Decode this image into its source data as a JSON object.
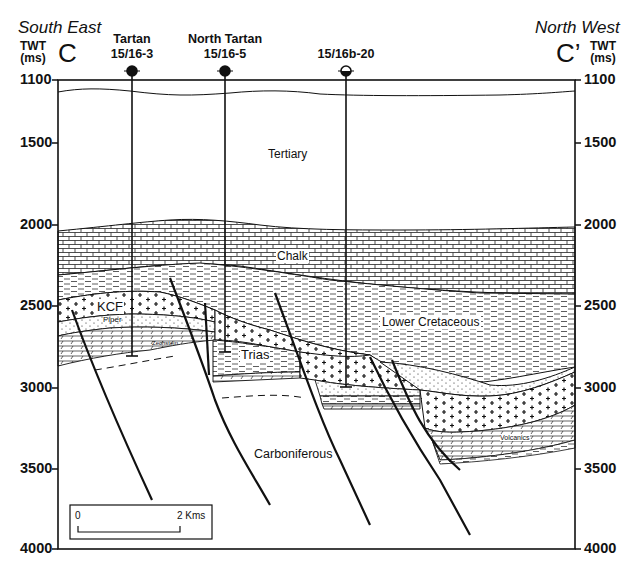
{
  "header": {
    "left_direction": "South East",
    "right_direction": "North West",
    "left_section_label": "C",
    "right_section_label": "C’",
    "axis_title_line1": "TWT",
    "axis_title_line2": "(ms)"
  },
  "wells": [
    {
      "name": "Tartan",
      "id": "15/16-3",
      "symbol": "oil-well-filled-circle",
      "x": 132,
      "td_ms": 2810
    },
    {
      "name": "North Tartan",
      "id": "15/16-5",
      "symbol": "oil-well-filled-circle",
      "x": 225,
      "td_ms": 2790
    },
    {
      "name": "",
      "id": "15/16b-20",
      "symbol": "oil-show-half-circle",
      "x": 346,
      "td_ms": 3010
    }
  ],
  "axis": {
    "unit": "TWT (ms)",
    "ticks": [
      "1100",
      "1500",
      "2000",
      "2500",
      "3000",
      "3500",
      "4000"
    ],
    "range": [
      1100,
      4000
    ]
  },
  "units": {
    "tertiary": "Tertiary",
    "chalk": "Chalk",
    "lower_cretaceous": "Lower Cretaceous",
    "kcf": "KCF",
    "piper": "Piper",
    "zechstein": "Zechstein",
    "trias": "Trias",
    "volcanics": "Volcanics",
    "carboniferous": "Carboniferous"
  },
  "scale_bar": {
    "start": "0",
    "end": "2 Kms"
  },
  "colors": {
    "line": "#111111",
    "background": "#ffffff"
  }
}
